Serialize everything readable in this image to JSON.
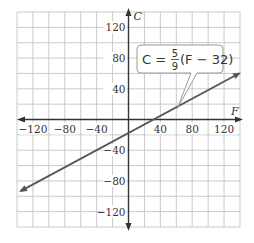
{
  "chart_data": {
    "type": "line",
    "title": "",
    "xlabel": "F",
    "ylabel": "C",
    "xlim": [
      -140,
      140
    ],
    "ylim": [
      -140,
      140
    ],
    "grid": true,
    "grid_step": 20,
    "x_ticks": [
      -120,
      -80,
      -40,
      40,
      80,
      120
    ],
    "y_ticks": [
      120,
      80,
      40,
      -40,
      -80,
      -120
    ],
    "x_tick_labels": [
      "−120",
      "−80",
      "−40",
      "40",
      "80",
      "120"
    ],
    "y_tick_labels": [
      "120",
      "80",
      "40",
      "−40",
      "−80",
      "−120"
    ],
    "series": [
      {
        "name": "C = 5/9(F − 32)",
        "equation": "C = (5/9)(F - 32)",
        "x": [
          -140,
          140
        ],
        "y": [
          -95.6,
          60.0
        ],
        "color": "#555555",
        "arrows": "both"
      }
    ],
    "annotations": [
      {
        "text": "C = 5/9 (F − 32)",
        "parts": {
          "lhs": "C =",
          "num": "5",
          "den": "9",
          "rhs": "(F − 32)"
        },
        "type": "callout",
        "points_to": [
          60,
          15.6
        ]
      }
    ],
    "legend": "none"
  }
}
